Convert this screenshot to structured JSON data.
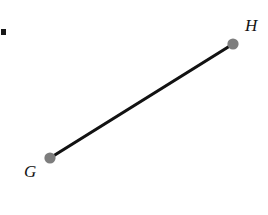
{
  "figure": {
    "type": "geometry-line-segment",
    "background_color": "#ffffff",
    "width": 268,
    "height": 215,
    "segment": {
      "name": "GH",
      "stroke_color": "#121212",
      "stroke_width": 3.2,
      "from": {
        "label": "G",
        "x": 50,
        "y": 158
      },
      "to": {
        "label": "H",
        "x": 233,
        "y": 44
      }
    },
    "endpoints": [
      {
        "label": "G",
        "x": 50,
        "y": 158,
        "radius": 5.6,
        "dot_color": "#7d7d7d",
        "label_x": 24,
        "label_y": 163
      },
      {
        "label": "H",
        "x": 233,
        "y": 44,
        "radius": 5.6,
        "dot_color": "#7d7d7d",
        "label_x": 245,
        "label_y": 17
      }
    ],
    "stray_mark": {
      "name": "edge-dot-artifact",
      "x": 1,
      "y": 29,
      "width": 5,
      "height": 6,
      "color": "#181818"
    }
  }
}
